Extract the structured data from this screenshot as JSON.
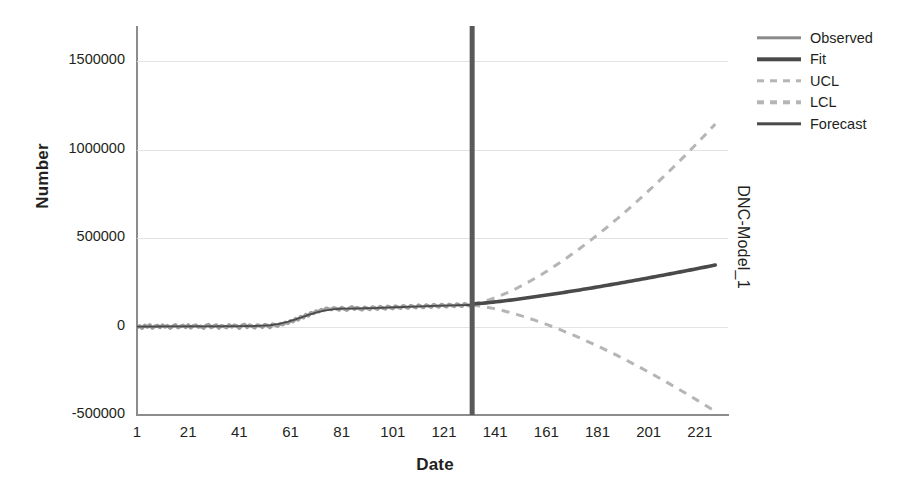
{
  "chart_data": {
    "type": "line",
    "title": "",
    "xlabel": "Date",
    "ylabel": "Number",
    "right_label": "DNC-Model_1",
    "xlim": [
      1,
      232
    ],
    "ylim": [
      -500000,
      1700000
    ],
    "yticks": [
      1500000,
      1000000,
      500000,
      0,
      -500000
    ],
    "ytick_labels": [
      "1500000",
      "1000000",
      "500000",
      "0",
      "-500000"
    ],
    "xticks": [
      1,
      21,
      41,
      61,
      81,
      101,
      121,
      141,
      161,
      181,
      201,
      221
    ],
    "xtick_labels": [
      "1",
      "21",
      "41",
      "61",
      "81",
      "101",
      "121",
      "141",
      "161",
      "181",
      "201",
      "221"
    ],
    "grid": true,
    "grid_axis": "y",
    "legend_position": "right-top",
    "forecast_split_x": 132,
    "observed_end_x": 132,
    "annotations": [
      {
        "name": "forecast-divider",
        "type": "vline",
        "x": 132,
        "label": ""
      }
    ],
    "series": [
      {
        "name": "Observed",
        "style": "solid",
        "color": "#8a8a8a",
        "x_start": 1,
        "x_end": 132,
        "values": [
          -6000,
          4000,
          -9000,
          7000,
          -3000,
          9000,
          -8000,
          2000,
          6000,
          -5000,
          8000,
          -2000,
          5000,
          -9000,
          3000,
          10000,
          -6000,
          1000,
          7000,
          -4000,
          9000,
          -7000,
          4000,
          8000,
          -3000,
          2000,
          -9000,
          6000,
          11000,
          -5000,
          3000,
          9000,
          -8000,
          5000,
          1000,
          -6000,
          10000,
          -2000,
          7000,
          4000,
          -9000,
          6000,
          12000,
          -4000,
          8000,
          2000,
          -7000,
          9000,
          5000,
          -3000,
          11000,
          6000,
          -5000,
          14000,
          9000,
          3000,
          17000,
          11000,
          24000,
          19000,
          33000,
          28000,
          45000,
          38000,
          57000,
          50000,
          68000,
          61000,
          79000,
          74000,
          88000,
          83000,
          96000,
          91000,
          104000,
          99000,
          97000,
          106000,
          101000,
          94000,
          108000,
          100000,
          93000,
          105000,
          112000,
          99000,
          107000,
          101000,
          95000,
          109000,
          103000,
          97000,
          111000,
          105000,
          99000,
          113000,
          106000,
          100000,
          115000,
          108000,
          102000,
          116000,
          110000,
          104000,
          118000,
          111000,
          105000,
          119000,
          113000,
          107000,
          121000,
          114000,
          108000,
          122000,
          116000,
          110000,
          124000,
          117000,
          111000,
          125000,
          119000,
          112000,
          126000,
          120000,
          114000,
          128000,
          121000,
          115000,
          129000,
          123000,
          117000,
          131000
        ]
      },
      {
        "name": "Fit",
        "style": "solid",
        "color": "#4a4a4a",
        "x_start": 1,
        "x_end": 132,
        "note": "smooth fit overlaying the observed series"
      },
      {
        "name": "UCL",
        "style": "dashed",
        "color": "#b5b5b5",
        "x_start": 132,
        "x_end": 227,
        "start_value": 130000,
        "end_value": 1145000
      },
      {
        "name": "LCL",
        "style": "dashed",
        "color": "#b5b5b5",
        "x_start": 132,
        "x_end": 227,
        "start_value": 120000,
        "end_value": -480000
      },
      {
        "name": "Forecast",
        "style": "solid",
        "color": "#4a4a4a",
        "x_start": 132,
        "x_end": 227,
        "start_value": 128000,
        "end_value": 348000
      }
    ]
  },
  "legend": {
    "items": [
      {
        "label": "Observed",
        "style": "solid",
        "color": "#8a8a8a"
      },
      {
        "label": "Fit",
        "style": "solid",
        "color": "#4a4a4a"
      },
      {
        "label": "UCL",
        "style": "dashed",
        "color": "#b5b5b5"
      },
      {
        "label": "LCL",
        "style": "dashed",
        "color": "#b5b5b5"
      },
      {
        "label": "Forecast",
        "style": "solid",
        "color": "#4a4a4a"
      }
    ]
  },
  "colors": {
    "observed": "#8a8a8a",
    "fit": "#4a4a4a",
    "limits": "#b5b5b5",
    "forecast": "#4a4a4a",
    "divider": "#595959",
    "grid": "#e3e3e3",
    "axis": "#8c8c8c",
    "text": "#231f20",
    "background": "#ffffff"
  }
}
